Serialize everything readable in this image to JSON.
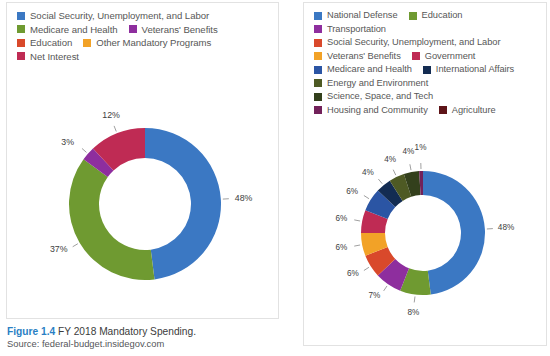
{
  "caption": {
    "figure_label": "Figure 1.4",
    "title": "FY 2018 Mandatory Spending.",
    "source": "Source: federal-budget.insidegov.com",
    "figure_color": "#2a7fc4"
  },
  "left_panel": {
    "legend_rows": [
      [
        {
          "label": "Social Security, Unemployment, and Labor",
          "color": "#3b78c3"
        }
      ],
      [
        {
          "label": "Medicare and Health",
          "color": "#6f9a31"
        },
        {
          "label": "Veterans' Benefits",
          "color": "#8e2e9e"
        }
      ],
      [
        {
          "label": "Education",
          "color": "#d9492b"
        },
        {
          "label": "Other Mandatory Programs",
          "color": "#f2a227"
        }
      ],
      [
        {
          "label": "Net Interest",
          "color": "#bf2b54"
        }
      ]
    ]
  },
  "right_panel": {
    "legend_rows": [
      [
        {
          "label": "National Defense",
          "color": "#3b78c3"
        },
        {
          "label": "Education",
          "color": "#6f9a31"
        }
      ],
      [
        {
          "label": "Transportation",
          "color": "#8e2e9e"
        }
      ],
      [
        {
          "label": "Social Security, Unemployment, and Labor",
          "color": "#d9492b"
        }
      ],
      [
        {
          "label": "Veterans' Benefits",
          "color": "#f2a227"
        },
        {
          "label": "Government",
          "color": "#bf2b54"
        }
      ],
      [
        {
          "label": "Medicare and Health",
          "color": "#2b55a4"
        },
        {
          "label": "International Affairs",
          "color": "#132c52"
        }
      ],
      [
        {
          "label": "Energy and Environment",
          "color": "#4e5a24"
        }
      ],
      [
        {
          "label": "Science, Space, and Tech",
          "color": "#33401c"
        }
      ],
      [
        {
          "label": "Housing and Community",
          "color": "#72215a"
        },
        {
          "label": "Agriculture",
          "color": "#5e1418"
        }
      ]
    ]
  },
  "chart_data": [
    {
      "type": "pie",
      "id": "mandatory-spending-donut",
      "title": "FY 2018 Mandatory Spending",
      "donut": true,
      "legend_position": "top",
      "categories": [
        "Social Security, Unemployment, and Labor",
        "Medicare and Health",
        "Veterans' Benefits",
        "Net Interest"
      ],
      "values": [
        48,
        37,
        3,
        12
      ],
      "labels": [
        "48%",
        "37%",
        "3%",
        "12%"
      ],
      "colors": [
        "#3b78c3",
        "#6f9a31",
        "#8e2e9e",
        "#bf2b54"
      ]
    },
    {
      "type": "pie",
      "id": "discretionary-spending-donut",
      "title": "FY 2018 Spending Breakdown",
      "donut": true,
      "legend_position": "top",
      "categories": [
        "National Defense",
        "Education",
        "Transportation",
        "Social Security, Unemployment, and Labor",
        "Veterans' Benefits",
        "Government",
        "Medicare and Health",
        "International Affairs",
        "Energy and Environment",
        "Science, Space, and Tech",
        "Housing and Community"
      ],
      "values": [
        48,
        8,
        7,
        6,
        6,
        6,
        6,
        4,
        4,
        4,
        1
      ],
      "labels": [
        "48%",
        "8%",
        "7%",
        "6%",
        "6%",
        "6%",
        "6%",
        "4%",
        "4%",
        "4%",
        "1%"
      ],
      "colors": [
        "#3b78c3",
        "#6f9a31",
        "#8e2e9e",
        "#d9492b",
        "#f2a227",
        "#bf2b54",
        "#2b55a4",
        "#132c52",
        "#4e5a24",
        "#33401c",
        "#72215a"
      ]
    }
  ]
}
